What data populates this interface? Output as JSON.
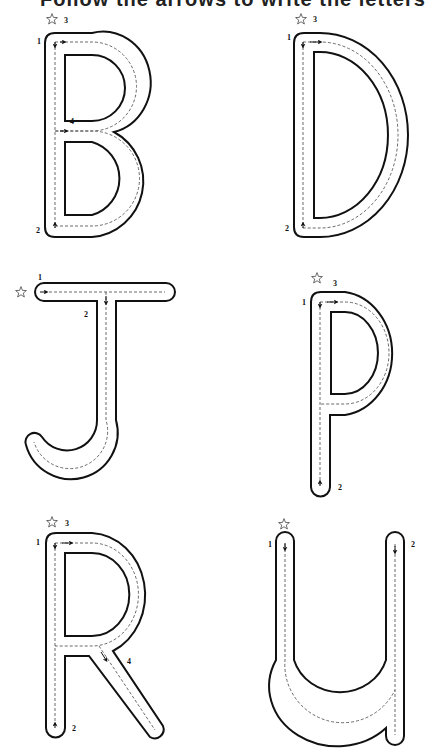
{
  "title": "Follow the arrows to write the letters",
  "letters": [
    {
      "letter": "B",
      "steps": [
        "1",
        "2",
        "3",
        "4"
      ]
    },
    {
      "letter": "D",
      "steps": [
        "1",
        "2",
        "3"
      ]
    },
    {
      "letter": "J",
      "steps": [
        "1",
        "2"
      ]
    },
    {
      "letter": "P",
      "steps": [
        "1",
        "2",
        "3"
      ]
    },
    {
      "letter": "R",
      "steps": [
        "1",
        "2",
        "3",
        "4"
      ]
    },
    {
      "letter": "U",
      "steps": [
        "1",
        "2"
      ]
    }
  ],
  "labels": {
    "b1": "1",
    "b2": "2",
    "b3": "3",
    "b4": "4",
    "d1": "1",
    "d2": "2",
    "d3": "3",
    "j1": "1",
    "j2": "2",
    "p1": "1",
    "p2": "2",
    "p3": "3",
    "r1": "1",
    "r2": "2",
    "r3": "3",
    "r4": "4",
    "u1": "1",
    "u2": "2"
  }
}
